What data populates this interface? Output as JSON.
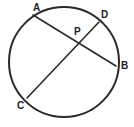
{
  "figure": {
    "background_color": "#ffffff",
    "stroke_color": "#2a2a2a",
    "label_color": "#1e1e1e",
    "width": 134,
    "height": 127
  },
  "chart_data": {
    "type": "diagram",
    "diagram_kind": "euclidean-geometry",
    "canvas": {
      "width": 134,
      "height": 127
    },
    "circle": {
      "name": "main-circle",
      "center": {
        "x": 64,
        "y": 62
      },
      "radius": 55,
      "stroke": "#2a2a2a",
      "stroke_width": 2,
      "fill": "none"
    },
    "points": [
      {
        "id": "A",
        "label": "A",
        "x": 33,
        "y": 15,
        "on_circle": true,
        "label_x": 33,
        "label_y": 3
      },
      {
        "id": "B",
        "label": "B",
        "x": 116,
        "y": 66,
        "on_circle": true,
        "label_x": 121,
        "label_y": 61
      },
      {
        "id": "C",
        "label": "C",
        "x": 27,
        "y": 98,
        "on_circle": true,
        "label_x": 17,
        "label_y": 101
      },
      {
        "id": "D",
        "label": "D",
        "x": 99,
        "y": 22,
        "on_circle": true,
        "label_x": 101,
        "label_y": 10
      },
      {
        "id": "P",
        "label": "P",
        "x": 78,
        "y": 45,
        "on_circle": false,
        "label_x": 74,
        "label_y": 27
      }
    ],
    "segments": [
      {
        "id": "AB",
        "label": "AB",
        "from": "A",
        "to": "B",
        "x1": 33,
        "y1": 15,
        "x2": 116,
        "y2": 66,
        "stroke": "#2a2a2a",
        "stroke_width": 1.6
      },
      {
        "id": "CD",
        "label": "CD",
        "from": "C",
        "to": "D",
        "x1": 27,
        "y1": 98,
        "x2": 99,
        "y2": 22,
        "stroke": "#2a2a2a",
        "stroke_width": 1.6
      }
    ],
    "intersections": [
      {
        "id": "P",
        "of": [
          "AB",
          "CD"
        ],
        "x": 78,
        "y": 45
      }
    ],
    "labels": [
      "A",
      "D",
      "P",
      "B",
      "C"
    ]
  }
}
